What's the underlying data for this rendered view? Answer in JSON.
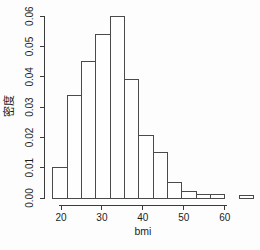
{
  "figure": {
    "background": "#fdfdfd",
    "axis_color": "#3a3a3a",
    "bar_border_color": "#4a4a4a",
    "bar_fill_color": "#fefefe",
    "text_color": "#1c1c1c"
  },
  "chart_data": {
    "type": "bar",
    "subtype": "histogram",
    "title": "",
    "xlabel": "bmi",
    "ylabel": "密度",
    "xlim": [
      18,
      67
    ],
    "ylim": [
      0,
      0.06
    ],
    "grid": false,
    "x_tick_labels": [
      "20",
      "30",
      "40",
      "50",
      "60"
    ],
    "x_tick_values": [
      20,
      30,
      40,
      50,
      60
    ],
    "y_tick_labels": [
      "0.00",
      "0.01",
      "0.02",
      "0.03",
      "0.04",
      "0.05",
      "0.06"
    ],
    "y_tick_values": [
      0,
      0.01,
      0.02,
      0.03,
      0.04,
      0.05,
      0.06
    ],
    "bin_width": 3.5,
    "bin_edges": [
      18,
      21.5,
      25,
      28.5,
      32,
      35.5,
      39,
      42.5,
      46,
      49.5,
      53,
      56.5,
      60,
      63.5,
      67
    ],
    "densities": [
      0.01,
      0.034,
      0.045,
      0.054,
      0.06,
      0.039,
      0.0205,
      0.015,
      0.005,
      0.002,
      0.0012,
      0.0012,
      0,
      0.0007
    ]
  }
}
